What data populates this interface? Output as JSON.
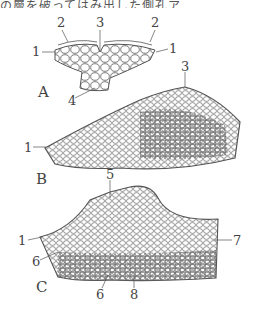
{
  "caption_fragment": "の層を破ってはみ出した側孔ア",
  "panels": {
    "A": {
      "label": "A",
      "markers": [
        "2",
        "3",
        "2",
        "1",
        "1",
        "4"
      ]
    },
    "B": {
      "label": "B",
      "markers": [
        "3",
        "1"
      ]
    },
    "C": {
      "label": "C",
      "markers": [
        "5",
        "1",
        "7",
        "6",
        "6",
        "8"
      ]
    }
  },
  "colors": {
    "line": "#555555",
    "background": "#ffffff"
  }
}
